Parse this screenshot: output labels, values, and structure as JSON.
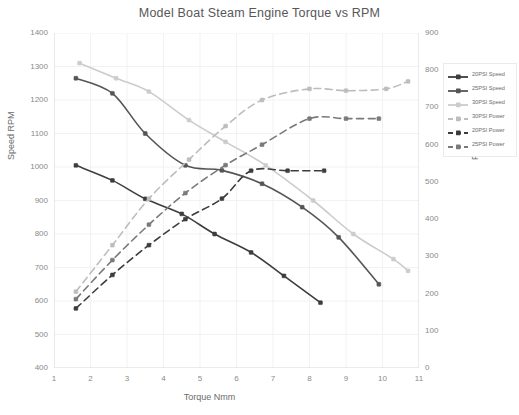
{
  "chart_data": {
    "type": "line",
    "title": "Model Boat Steam Engine Torque vs RPM",
    "xlabel": "Torque Nmm",
    "ylabel": "Speed RPM",
    "y2label": "Power (mW)",
    "xlim": [
      1,
      11
    ],
    "ylim": [
      400,
      1400
    ],
    "y2lim": [
      0,
      900
    ],
    "grid": true,
    "legend_position": "right",
    "xticks": [
      1,
      2,
      3,
      4,
      5,
      6,
      7,
      8,
      9,
      10,
      11
    ],
    "yticks": [
      400,
      500,
      600,
      700,
      800,
      900,
      1000,
      1100,
      1200,
      1300,
      1400
    ],
    "y2ticks": [
      0,
      100,
      200,
      300,
      400,
      500,
      600,
      700,
      800,
      900
    ],
    "series": [
      {
        "name": "20PSI Speed",
        "axis": "left",
        "style": "solid",
        "color": "#3d3d3d",
        "x": [
          1.6,
          2.6,
          3.5,
          4.5,
          5.4,
          6.4,
          7.3,
          8.3
        ],
        "y": [
          1005,
          960,
          905,
          860,
          800,
          745,
          675,
          595
        ]
      },
      {
        "name": "25PSI Speed",
        "axis": "left",
        "style": "solid",
        "color": "#555555",
        "x": [
          1.6,
          2.6,
          3.5,
          4.6,
          5.6,
          6.7,
          7.8,
          8.8,
          9.9
        ],
        "y": [
          1265,
          1220,
          1100,
          1005,
          990,
          950,
          880,
          790,
          650
        ]
      },
      {
        "name": "30PSI Speed",
        "axis": "left",
        "style": "solid",
        "color": "#cccccc",
        "x": [
          1.7,
          2.7,
          3.6,
          4.7,
          5.7,
          6.8,
          8.1,
          9.2,
          10.3,
          10.7
        ],
        "y": [
          1310,
          1265,
          1225,
          1140,
          1075,
          1005,
          900,
          800,
          725,
          690
        ]
      },
      {
        "name": "30PSI Power",
        "axis": "right",
        "style": "dashed",
        "color": "#bdbdbd",
        "x": [
          1.6,
          2.6,
          3.6,
          4.7,
          5.7,
          6.7,
          8.0,
          9.0,
          10.1,
          10.7
        ],
        "y": [
          205,
          330,
          455,
          560,
          650,
          720,
          750,
          745,
          750,
          770
        ]
      },
      {
        "name": "20PSI Power",
        "axis": "right",
        "style": "dashed",
        "color": "#3d3d3d",
        "x": [
          1.6,
          2.6,
          3.6,
          4.6,
          5.6,
          6.4,
          7.4,
          8.4
        ],
        "y": [
          160,
          250,
          330,
          400,
          455,
          530,
          530,
          530
        ]
      },
      {
        "name": "25PSI Power",
        "axis": "right",
        "style": "dashed",
        "color": "#7a7a7a",
        "x": [
          1.6,
          2.6,
          3.6,
          4.6,
          5.7,
          6.7,
          8.0,
          9.0,
          9.9
        ],
        "y": [
          185,
          290,
          385,
          470,
          545,
          600,
          670,
          670,
          670
        ]
      }
    ]
  },
  "legend": {
    "items": [
      {
        "label": "20PSI Speed"
      },
      {
        "label": "25PSI Speed"
      },
      {
        "label": "30PSI Speed"
      },
      {
        "label": "30PSI Power"
      },
      {
        "label": "20PSI Power"
      },
      {
        "label": "25PSI Power"
      }
    ]
  }
}
